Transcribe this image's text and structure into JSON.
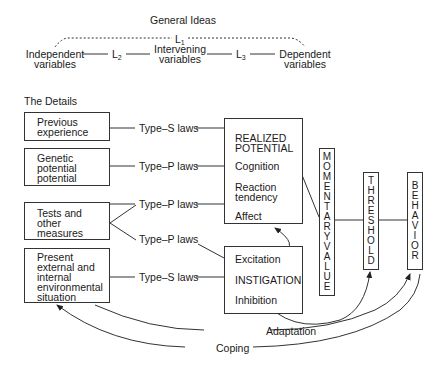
{
  "general": {
    "title": "General Ideas",
    "l1": "L",
    "l1_sub": "1",
    "l2": "L",
    "l2_sub": "2",
    "l3": "L",
    "l3_sub": "3",
    "independent": [
      "Independent",
      "variables"
    ],
    "intervening": [
      "Intervening",
      "variables"
    ],
    "dependent": [
      "Dependent",
      "variables"
    ]
  },
  "details": {
    "title": "The Details",
    "inputs": [
      {
        "lines": [
          "Previous",
          "experience"
        ]
      },
      {
        "lines": [
          "Genetic",
          "potential",
          "potential"
        ]
      },
      {
        "lines": [
          "Tests and",
          "other",
          "measures"
        ]
      },
      {
        "lines": [
          "Present",
          "external and",
          "internal",
          "environmental",
          "situation"
        ]
      }
    ],
    "laws": [
      "Type–S laws",
      "Type–P laws",
      "Type–P laws",
      "Type–P laws",
      "Type–S laws"
    ],
    "realized": {
      "title": [
        "REALIZED",
        "POTENTIAL"
      ],
      "items": [
        "Cognition",
        "Reaction",
        "tendency",
        "Affect"
      ]
    },
    "instigation": {
      "items": [
        "Excitation",
        "INSTIGATION",
        "Inhibition"
      ]
    },
    "momentary": "MOMENTARYVALUE",
    "threshold": "THRESHOLD",
    "behavior": "BEHAVIOR",
    "feedback": [
      "Adaptation",
      "Coping"
    ]
  }
}
